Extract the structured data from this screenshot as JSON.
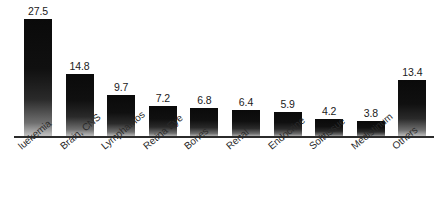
{
  "chart_data": {
    "type": "bar",
    "title": "",
    "xlabel": "",
    "ylabel": "",
    "ylim": [
      0,
      27.5
    ],
    "grid": false,
    "legend": "none",
    "categories": [
      "luekemia",
      "Brain, CNS",
      "Lymphamos",
      "Retina Eye",
      "Bones",
      "Renal",
      "Endocrine",
      "Softtissue",
      "Medistinum",
      "Others"
    ],
    "values": [
      27.5,
      14.8,
      9.7,
      7.2,
      6.8,
      6.4,
      5.9,
      4.2,
      3.8,
      13.4
    ],
    "value_labels": [
      "27.5",
      "14.8",
      "9.7",
      "7.2",
      "6.8",
      "6.4",
      "5.9",
      "4.2",
      "3.8",
      "13.4"
    ],
    "bar_color": "#101010",
    "baseline_color": "#2b2b2b",
    "background_color": "#ffffff"
  }
}
